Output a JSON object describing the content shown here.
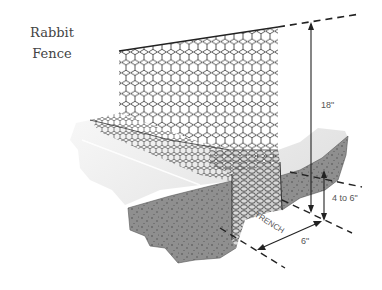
{
  "title": {
    "line1": "Rabbit",
    "line2": "Fence"
  },
  "dimensions": {
    "fence_height": "18\"",
    "trench_depth": "4 to 6\"",
    "trench_width": "6\""
  },
  "labels": {
    "trench": "TRENCH"
  },
  "colors": {
    "mesh": "#2a2a2a",
    "ground_surface": "#eeeeee",
    "soil": "#8e8e8e",
    "soil_dots": "#555555",
    "dimension_lines": "#222222",
    "text": "#555555"
  }
}
